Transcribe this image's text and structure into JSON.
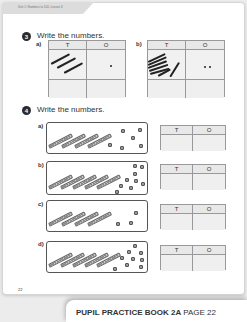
{
  "header": {
    "breadcrumb": "Unit 1: Numbers to 100, Lesson 6"
  },
  "question3": {
    "number": "3",
    "title": "Write the numbers.",
    "parts": [
      {
        "label": "a)",
        "columns": [
          "T",
          "O"
        ],
        "tens_strokes": 3,
        "ones_dots": 1
      },
      {
        "label": "b)",
        "columns": [
          "T",
          "O"
        ],
        "tens_strokes": 7,
        "ones_dots": 2
      }
    ]
  },
  "question4": {
    "number": "4",
    "title": "Write the numbers.",
    "parts": [
      {
        "label": "a)",
        "columns": [
          "T",
          "O"
        ],
        "tens_rods": 4,
        "ones_cubes": 6
      },
      {
        "label": "b)",
        "columns": [
          "T",
          "O"
        ],
        "tens_rods": 5,
        "ones_cubes": 9
      },
      {
        "label": "c)",
        "columns": [
          "T",
          "O"
        ],
        "tens_rods": 4,
        "ones_cubes": 3
      },
      {
        "label": "d)",
        "columns": [
          "T",
          "O"
        ],
        "tens_rods": 5,
        "ones_cubes": 9
      }
    ]
  },
  "page_number": "22",
  "footer": {
    "book": "PUPIL PRACTICE BOOK 2A",
    "page": "PAGE 22"
  }
}
